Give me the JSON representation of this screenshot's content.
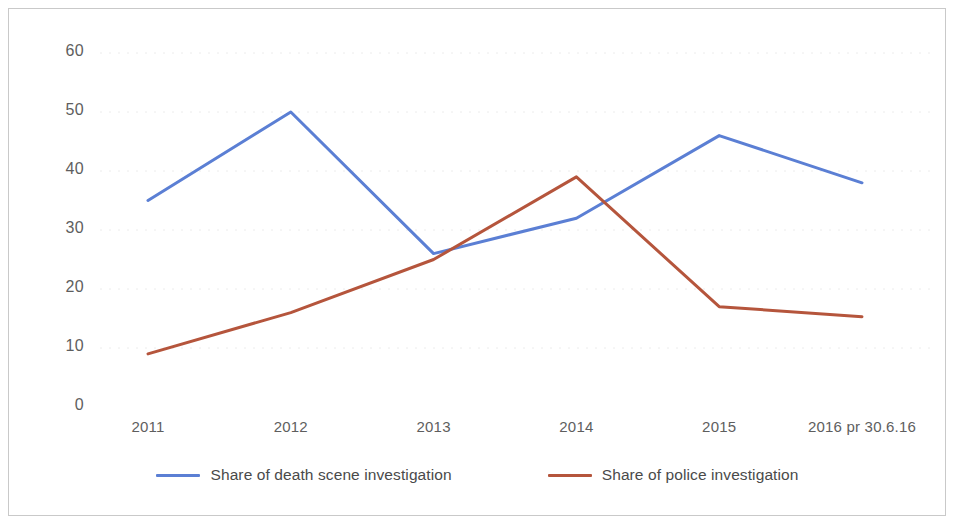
{
  "chart_data": {
    "type": "line",
    "title": "",
    "subtitle": "",
    "xlabel": "",
    "ylabel": "",
    "categories": [
      "2011",
      "2012",
      "2013",
      "2014",
      "2015",
      "2016 pr 30.6.16"
    ],
    "series": [
      {
        "name": "Share of death scene investigation",
        "color": "#5B7FD4",
        "values": [
          35,
          50,
          26,
          32,
          46,
          38
        ]
      },
      {
        "name": "Share of police investigation",
        "color": "#B5553C",
        "values": [
          9,
          16,
          25,
          39,
          17,
          15.3
        ]
      }
    ],
    "ylim": [
      0,
      60
    ],
    "ytick_labels": [
      "60",
      "50",
      "40",
      "30",
      "20",
      "10",
      "0"
    ],
    "ytick_values": [
      60,
      50,
      40,
      30,
      20,
      10,
      0
    ],
    "grid": true,
    "grid_axis": "y",
    "legend_position": "bottom",
    "legend": [
      "Share of death scene investigation",
      "Share of police investigation"
    ]
  },
  "colors": {
    "series_blue": "#5B7FD4",
    "series_red": "#B5553C",
    "frame_border": "#c9c9c9",
    "gridline": "#ececec",
    "tick_text": "#5e5e5e",
    "legend_text": "#4a4a4a",
    "background": "#ffffff"
  }
}
